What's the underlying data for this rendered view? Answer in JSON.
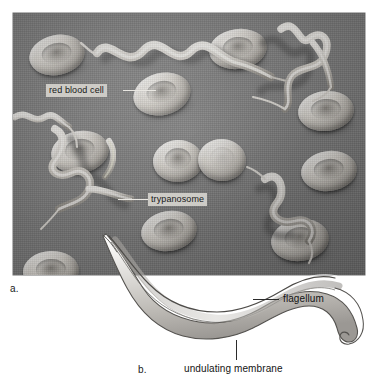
{
  "figure": {
    "panels": [
      {
        "letter": "a.",
        "type": "scanning-electron-micrograph"
      },
      {
        "letter": "b.",
        "type": "line-drawing"
      }
    ]
  },
  "panel_a": {
    "letter": "a.",
    "labels": [
      {
        "id": "red-blood-cell",
        "text": "red blood cell"
      },
      {
        "id": "trypanosome",
        "text": "trypanosome"
      }
    ],
    "background_color": "#7e7e7e",
    "cell_color": "#dedad3"
  },
  "panel_b": {
    "letter": "b.",
    "labels": [
      {
        "id": "flagellum",
        "text": "flagellum"
      },
      {
        "id": "undulating-membrane",
        "text": "undulating membrane"
      }
    ],
    "outline_color": "#4a4a4a",
    "fill_color": "#d9d7d3"
  }
}
